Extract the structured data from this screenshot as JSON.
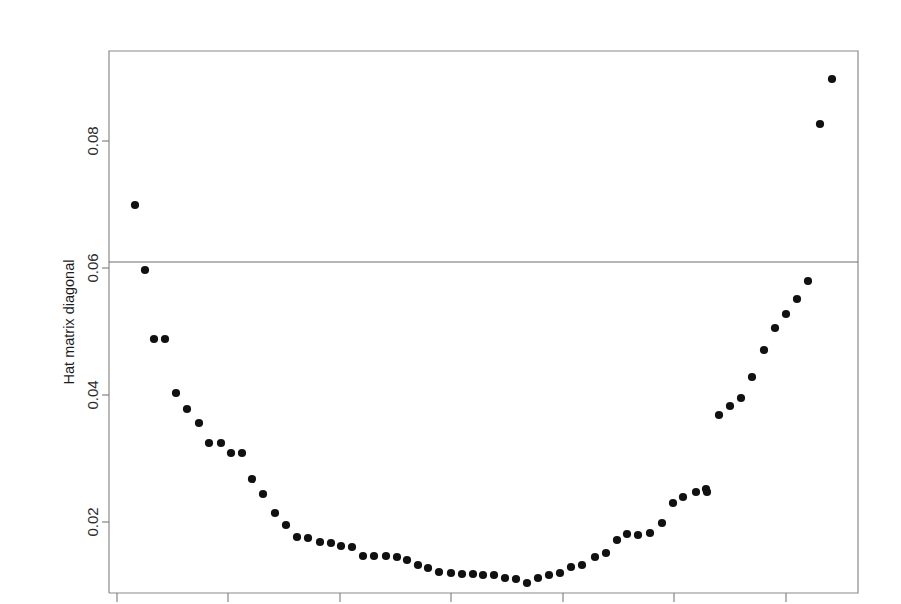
{
  "figure": {
    "background_color": "#ffffff",
    "point_color": "#111111",
    "axis_color": "#7a7a7a",
    "plot_box": {
      "left": 109,
      "top": 51,
      "right": 858,
      "bottom": 593
    }
  },
  "axes": {
    "y_title": "Hat matrix diagonal",
    "x_title": "",
    "y_ticks": [
      {
        "value": 0.02,
        "label": "0.02",
        "py": 522
      },
      {
        "value": 0.04,
        "label": "0.04",
        "py": 395
      },
      {
        "value": 0.06,
        "label": "0.06",
        "py": 268
      },
      {
        "value": 0.08,
        "label": "0.08",
        "py": 141
      }
    ],
    "x_ticks": [
      {
        "label": "",
        "px": 117
      },
      {
        "label": "",
        "px": 228
      },
      {
        "label": "",
        "px": 340
      },
      {
        "label": "",
        "px": 451
      },
      {
        "label": "",
        "px": 563
      },
      {
        "label": "",
        "px": 674
      },
      {
        "label": "",
        "px": 786
      }
    ]
  },
  "annotations": [
    {
      "name": "threshold-reference-line",
      "type": "horizontal-line",
      "value": 0.0615,
      "py": 262,
      "label": ""
    }
  ],
  "chart_data": {
    "type": "scatter",
    "title": "",
    "subtitle": "",
    "xlabel": "",
    "ylabel": "Hat matrix diagonal",
    "grid": false,
    "legend": null,
    "xlim": [
      1,
      70
    ],
    "ylim": [
      0.0145,
      0.0935
    ],
    "ytick_values": [
      0.02,
      0.04,
      0.06,
      0.08
    ],
    "ytick_labels": [
      "0.02",
      "0.04",
      "0.06",
      "0.08"
    ],
    "reference_lines": [
      {
        "orientation": "horizontal",
        "y": 0.0615
      }
    ],
    "n_points": 70,
    "x": [
      1,
      2,
      3,
      4,
      5,
      6,
      7,
      8,
      9,
      10,
      11,
      12,
      13,
      14,
      15,
      16,
      17,
      18,
      19,
      20,
      21,
      22,
      23,
      24,
      25,
      26,
      27,
      28,
      29,
      30,
      31,
      32,
      33,
      34,
      35,
      36,
      37,
      38,
      39,
      40,
      41,
      42,
      43,
      44,
      45,
      46,
      47,
      48,
      49,
      50,
      51,
      52,
      53,
      54,
      55,
      56,
      57,
      58,
      59,
      60,
      61,
      62,
      63,
      64,
      65,
      66,
      67,
      68,
      69,
      70
    ],
    "y": [
      0.07,
      0.061,
      0.0508,
      0.0508,
      0.0423,
      0.0398,
      0.0376,
      0.0345,
      0.0345,
      0.0329,
      0.0329,
      0.0288,
      0.0265,
      0.0235,
      0.0216,
      0.0197,
      0.0195,
      0.0189,
      0.0188,
      0.0184,
      0.0183,
      0.0169,
      0.0169,
      0.0169,
      0.0168,
      0.0163,
      0.016,
      0.0156,
      0.015,
      0.0153,
      0.015,
      0.0148,
      0.0148,
      0.0147,
      0.0146,
      0.0146,
      0.0141,
      0.0139,
      0.0133,
      0.0141,
      0.0146,
      0.0148,
      0.0157,
      0.016,
      0.0172,
      0.0178,
      0.0192,
      0.0203,
      0.0212,
      0.021,
      0.0209,
      0.0212,
      0.0222,
      0.0238,
      0.0272,
      0.0282,
      0.0282,
      0.029,
      0.04,
      0.0415,
      0.0428,
      0.0461,
      0.0497,
      0.0532,
      0.0552,
      0.0579,
      0.0598,
      0.0726,
      0.0829,
      0.09
    ],
    "points_px": [
      [
        135,
        205
      ],
      [
        145,
        270
      ],
      [
        154,
        339
      ],
      [
        165,
        339
      ],
      [
        176,
        393
      ],
      [
        187,
        409
      ],
      [
        199,
        423
      ],
      [
        209,
        443
      ],
      [
        221,
        443
      ],
      [
        231,
        453
      ],
      [
        242,
        453
      ],
      [
        252,
        479
      ],
      [
        263,
        494
      ],
      [
        275,
        513
      ],
      [
        286,
        525
      ],
      [
        297,
        537
      ],
      [
        308,
        538
      ],
      [
        320,
        542
      ],
      [
        331,
        543
      ],
      [
        341,
        546
      ],
      [
        352,
        547
      ],
      [
        363,
        556
      ],
      [
        374,
        556
      ],
      [
        386,
        556
      ],
      [
        397,
        557
      ],
      [
        407,
        560
      ],
      [
        418,
        565
      ],
      [
        428,
        568
      ],
      [
        439,
        572
      ],
      [
        451,
        573
      ],
      [
        462,
        574
      ],
      [
        473,
        574
      ],
      [
        483,
        575
      ],
      [
        494,
        575
      ],
      [
        505,
        578
      ],
      [
        516,
        579
      ],
      [
        527,
        583
      ],
      [
        538,
        578
      ],
      [
        549,
        575
      ],
      [
        560,
        573
      ],
      [
        571,
        567
      ],
      [
        582,
        565
      ],
      [
        595,
        557
      ],
      [
        606,
        553
      ],
      [
        617,
        540
      ],
      [
        627,
        534
      ],
      [
        638,
        535
      ],
      [
        650,
        533
      ],
      [
        662,
        523
      ],
      [
        673,
        503
      ],
      [
        683,
        497
      ],
      [
        696,
        492
      ],
      [
        707,
        492
      ],
      [
        719,
        415
      ],
      [
        730,
        406
      ],
      [
        741,
        398
      ],
      [
        752,
        377
      ],
      [
        764,
        350
      ],
      [
        775,
        328
      ],
      [
        786,
        314
      ],
      [
        797,
        299
      ],
      [
        808,
        281
      ],
      [
        820,
        124
      ],
      [
        832,
        79
      ],
      [
        706,
        489
      ],
      [
        595,
        557
      ],
      [
        483,
        575
      ],
      [
        352,
        547
      ],
      [
        221,
        443
      ],
      [
        145,
        270
      ]
    ]
  }
}
